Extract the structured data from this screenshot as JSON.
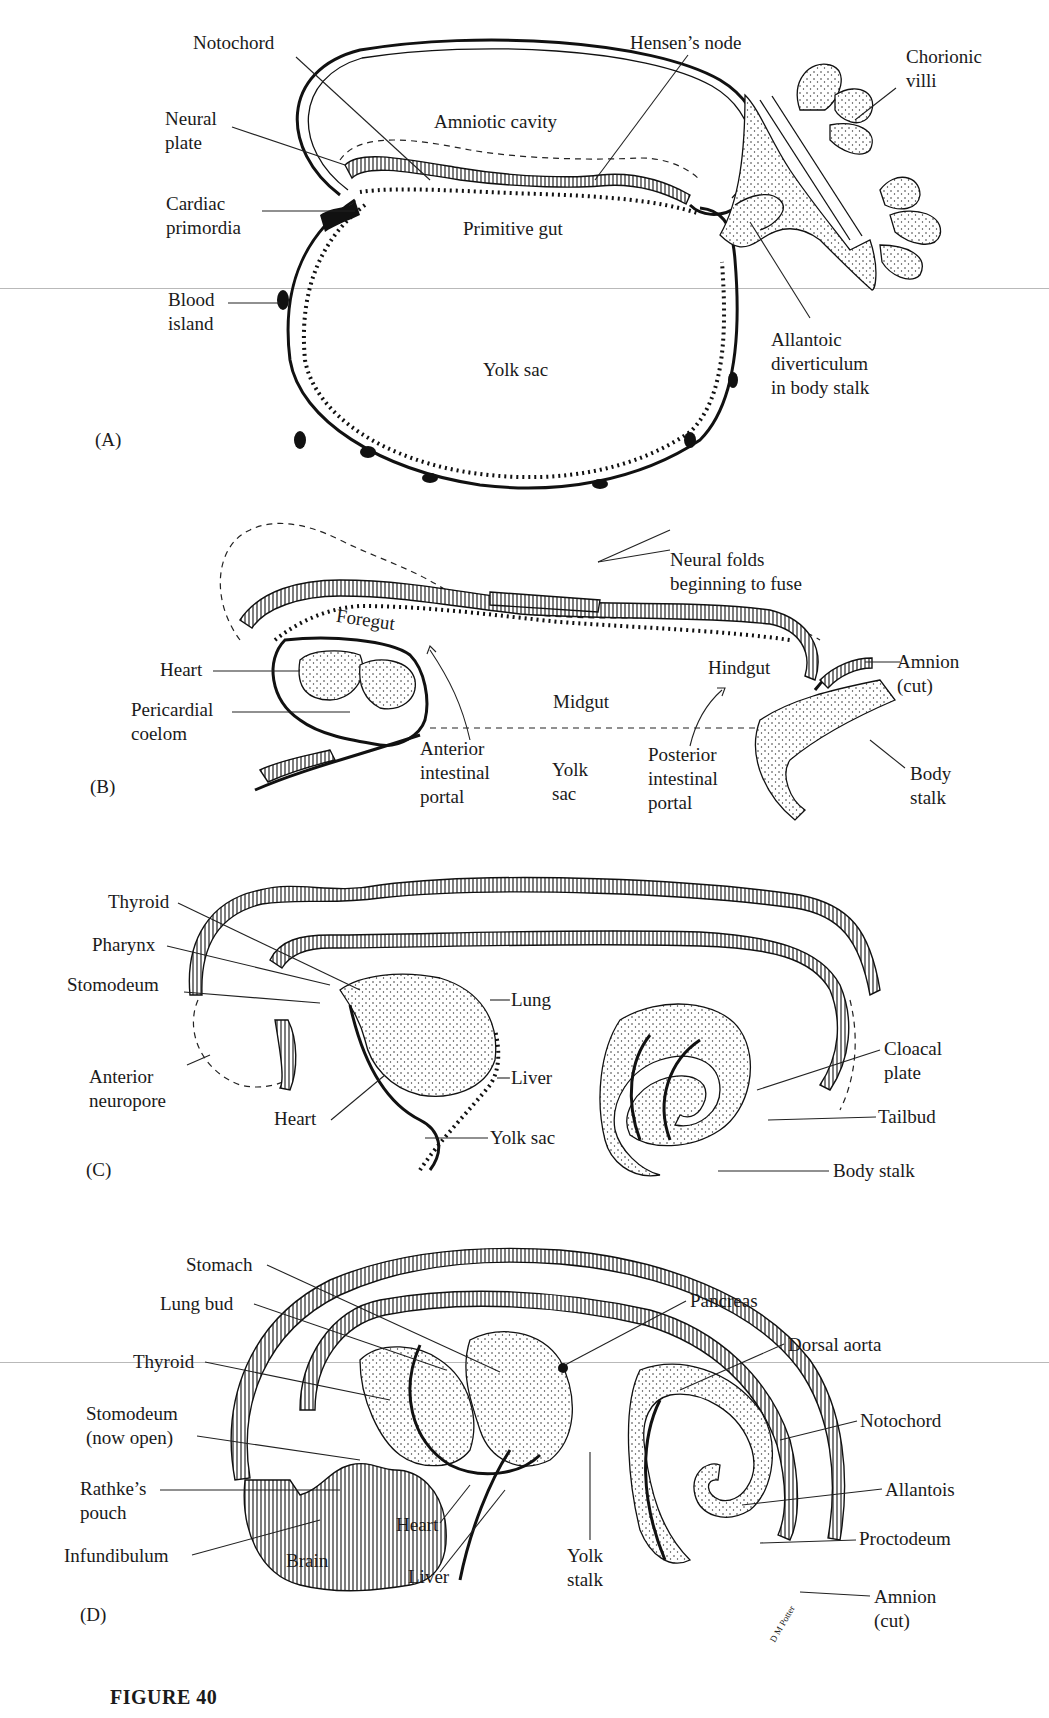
{
  "figure": {
    "caption": "FIGURE 40",
    "panels": [
      {
        "id": "A",
        "letter": "(A)",
        "labels": {
          "notochord": "Notochord",
          "hensens_node": "Hensen’s node",
          "chorionic_villi": "Chorionic\nvilli",
          "neural_plate": "Neural\nplate",
          "amniotic_cavity": "Amniotic cavity",
          "cardiac_primordia": "Cardiac\nprimordia",
          "primitive_gut": "Primitive gut",
          "blood_island": "Blood\nisland",
          "yolk_sac": "Yolk sac",
          "allantoic_diverticulum": "Allantoic\ndiverticulum\nin body stalk"
        }
      },
      {
        "id": "B",
        "letter": "(B)",
        "labels": {
          "neural_folds": "Neural folds\nbeginning to fuse",
          "foregut": "Foregut",
          "heart": "Heart",
          "pericardial_coelom": "Pericardial\ncoelom",
          "hindgut": "Hindgut",
          "amnion_cut": "Amnion\n(cut)",
          "midgut": "Midgut",
          "anterior_intestinal_portal": "Anterior\nintestinal\nportal",
          "yolk_sac": "Yolk\nsac",
          "posterior_intestinal_portal": "Posterior\nintestinal\nportal",
          "body_stalk": "Body\nstalk"
        }
      },
      {
        "id": "C",
        "letter": "(C)",
        "labels": {
          "thyroid": "Thyroid",
          "pharynx": "Pharynx",
          "stomodeum": "Stomodeum",
          "lung": "Lung",
          "anterior_neuropore": "Anterior\nneuropore",
          "liver": "Liver",
          "heart": "Heart",
          "yolk_sac": "Yolk sac",
          "cloacal_plate": "Cloacal\nplate",
          "tailbud": "Tailbud",
          "body_stalk": "Body stalk"
        }
      },
      {
        "id": "D",
        "letter": "(D)",
        "labels": {
          "stomach": "Stomach",
          "lung_bud": "Lung bud",
          "pancreas": "Pancreas",
          "dorsal_aorta": "Dorsal aorta",
          "thyroid": "Thyroid",
          "stomodeum": "Stomodeum\n(now open)",
          "notochord": "Notochord",
          "rathkes_pouch": "Rathke’s\npouch",
          "allantois": "Allantois",
          "heart": "Heart",
          "proctodeum": "Proctodeum",
          "infundibulum": "Infundibulum",
          "brain": "Brain",
          "yolk_stalk": "Yolk\nstalk",
          "liver": "Liver",
          "amnion_cut": "Amnion\n(cut)",
          "signature": "D M Potter"
        }
      }
    ]
  },
  "colors": {
    "ink": "#111111",
    "paper": "#ffffff",
    "scan_line": "#b9b9b9"
  }
}
